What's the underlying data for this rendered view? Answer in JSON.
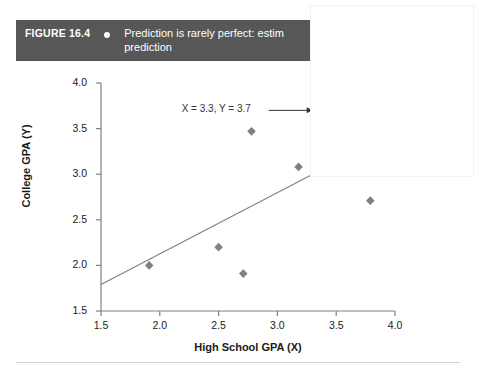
{
  "figure": {
    "label": "FIGURE 16.4",
    "bullet_icon": "bullet-dot",
    "caption": "Prediction is rarely perfect: estim\nprediction",
    "caption_truncated": true
  },
  "top_clipped_text": "",
  "colors": {
    "caption_bar": "#575757",
    "caption_text": "#ffffff",
    "marker": "#808080",
    "regression_line": "#808080",
    "axis": "#808080",
    "annotation_text": "#333333",
    "rule": "#d2d2d2",
    "overlay": "#ffffff"
  },
  "chart_data": {
    "type": "scatter",
    "title": "",
    "xlabel": "High School GPA (X)",
    "ylabel": "College GPA (Y)",
    "xlim": [
      1.5,
      4.0
    ],
    "ylim": [
      1.5,
      4.0
    ],
    "xticks": [
      "1.5",
      "2.0",
      "2.5",
      "3.0",
      "3.5",
      "4.0"
    ],
    "yticks": [
      "1.5",
      "2.0",
      "2.5",
      "3.0",
      "3.5",
      "4.0"
    ],
    "xtick_values": [
      1.5,
      2.0,
      2.5,
      3.0,
      3.5,
      4.0
    ],
    "ytick_values": [
      1.5,
      2.0,
      2.5,
      3.0,
      3.5,
      4.0
    ],
    "grid": false,
    "legend": null,
    "marker_shape": "diamond",
    "points": [
      {
        "x": 1.91,
        "y": 2.0
      },
      {
        "x": 2.5,
        "y": 2.2
      },
      {
        "x": 2.71,
        "y": 1.91
      },
      {
        "x": 2.78,
        "y": 3.47
      },
      {
        "x": 3.18,
        "y": 3.08
      },
      {
        "x": 3.79,
        "y": 2.71
      }
    ],
    "regression_line": {
      "x_start": 1.5,
      "y_start": 1.79,
      "x_end": 3.3,
      "y_end": 3.0
    },
    "annotations": [
      {
        "text": "X = 3.3, Y = 3.7",
        "x": 3.3,
        "y": 3.7,
        "arrow": true,
        "dropline": true
      }
    ]
  }
}
